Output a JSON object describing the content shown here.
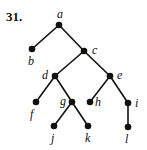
{
  "problem_number": "31.",
  "tree": {
    "nodes": [
      {
        "id": "a",
        "label": "a",
        "x": 59,
        "y": 25,
        "lx": 57,
        "ly": 18
      },
      {
        "id": "b",
        "label": "b",
        "x": 32,
        "y": 49,
        "lx": 28,
        "ly": 65
      },
      {
        "id": "c",
        "label": "c",
        "x": 84,
        "y": 51,
        "lx": 92,
        "ly": 54
      },
      {
        "id": "d",
        "label": "d",
        "x": 55,
        "y": 76,
        "lx": 42,
        "ly": 79
      },
      {
        "id": "e",
        "label": "e",
        "x": 110,
        "y": 76,
        "lx": 117,
        "ly": 79
      },
      {
        "id": "f",
        "label": "f",
        "x": 36,
        "y": 102,
        "lx": 30,
        "ly": 118
      },
      {
        "id": "g",
        "label": "g",
        "x": 72,
        "y": 102,
        "lx": 60,
        "ly": 105
      },
      {
        "id": "h",
        "label": "h",
        "x": 90,
        "y": 102,
        "lx": 95,
        "ly": 106
      },
      {
        "id": "i",
        "label": "i",
        "x": 128,
        "y": 103,
        "lx": 135,
        "ly": 107
      },
      {
        "id": "j",
        "label": "j",
        "x": 54,
        "y": 126,
        "lx": 51,
        "ly": 142
      },
      {
        "id": "k",
        "label": "k",
        "x": 88,
        "y": 126,
        "lx": 85,
        "ly": 142
      },
      {
        "id": "l",
        "label": "l",
        "x": 128,
        "y": 127,
        "lx": 125,
        "ly": 143
      }
    ],
    "edges": [
      [
        "a",
        "b"
      ],
      [
        "a",
        "c"
      ],
      [
        "c",
        "d"
      ],
      [
        "c",
        "e"
      ],
      [
        "d",
        "f"
      ],
      [
        "d",
        "g"
      ],
      [
        "g",
        "j"
      ],
      [
        "g",
        "k"
      ],
      [
        "e",
        "h"
      ],
      [
        "e",
        "i"
      ],
      [
        "i",
        "l"
      ]
    ]
  }
}
